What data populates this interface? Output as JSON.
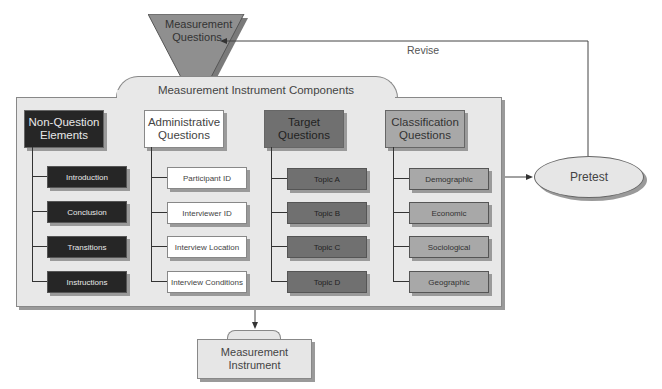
{
  "diagram": {
    "top_node": {
      "label_line1": "Measurement",
      "label_line2": "Questions"
    },
    "feedback_label": "Revise",
    "container_label": "Measurement Instrument Components",
    "pretest": "Pretest",
    "output_node": {
      "label_line1": "Measurement",
      "label_line2": "Instrument"
    },
    "columns": [
      {
        "head_line1": "Non-Question",
        "head_line2": "Elements",
        "items": [
          "Introduction",
          "Conclusion",
          "Transitions",
          "Instructions"
        ]
      },
      {
        "head_line1": "Administrative",
        "head_line2": "Questions",
        "items": [
          "Participant ID",
          "Interviewer ID",
          "Interview Location",
          "Interview Conditions"
        ]
      },
      {
        "head_line1": "Target",
        "head_line2": "Questions",
        "items": [
          "Topic A",
          "Topic B",
          "Topic C",
          "Topic D"
        ]
      },
      {
        "head_line1": "Classification",
        "head_line2": "Questions",
        "items": [
          "Demographic",
          "Economic",
          "Sociological",
          "Geographic"
        ]
      }
    ],
    "colors": {
      "dark": "#262626",
      "white": "#ffffff",
      "mid": "#707070",
      "light": "#a8a8a8",
      "container": "#e8e8e8"
    }
  }
}
